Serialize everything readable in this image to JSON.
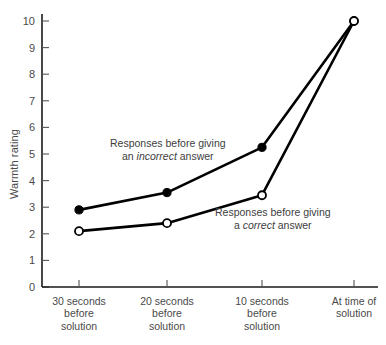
{
  "chart_data": {
    "type": "line",
    "title": "",
    "xlabel": "",
    "ylabel": "Warmth rating",
    "ylim": [
      0,
      10
    ],
    "yticks": [
      0,
      1,
      2,
      3,
      4,
      5,
      6,
      7,
      8,
      9,
      10
    ],
    "grid": false,
    "legend_position": "inline-annotations",
    "categories": [
      "30 seconds before solution",
      "20 seconds before solution",
      "10 seconds before solution",
      "At time of solution"
    ],
    "category_lines": [
      [
        "30 seconds",
        "before",
        "solution"
      ],
      [
        "20 seconds",
        "before",
        "solution"
      ],
      [
        "10 seconds",
        "before",
        "solution"
      ],
      [
        "At time of",
        "solution"
      ]
    ],
    "series": [
      {
        "name": "Responses before giving an incorrect answer",
        "marker": "filled-circle",
        "values": [
          2.9,
          3.55,
          5.25,
          10.0
        ]
      },
      {
        "name": "Responses before giving a correct answer",
        "marker": "open-circle",
        "values": [
          2.1,
          2.4,
          3.45,
          10.0
        ]
      }
    ],
    "annotations": [
      {
        "id": "incorrect",
        "line1": "Responses before giving",
        "line2_pre": "an ",
        "line2_em": "incorrect",
        "line2_post": " answer"
      },
      {
        "id": "correct",
        "line1": "Responses before giving",
        "line2_pre": "a ",
        "line2_em": "correct",
        "line2_post": " answer"
      }
    ],
    "colors": {
      "line": "#000000",
      "marker_filled": "#000000",
      "marker_open_fill": "#ffffff",
      "axis": "#1a1a1a",
      "text": "#4a4a4a"
    }
  }
}
